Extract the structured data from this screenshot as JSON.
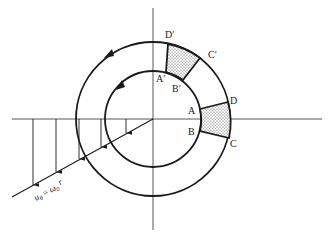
{
  "figure": {
    "colors": {
      "stroke": "#1a1a1a",
      "axis": "#444444",
      "background": "#ffffff",
      "stipple": "#333333"
    },
    "geometry": {
      "center": [
        153,
        119
      ],
      "outer_radius": 77,
      "inner_radius": 48,
      "horizontal_axis": [
        [
          12,
          119
        ],
        [
          322,
          119
        ]
      ],
      "vertical_axis": [
        [
          153,
          8
        ],
        [
          153,
          230
        ]
      ],
      "velocity_profile_line": [
        [
          153,
          119
        ],
        [
          12,
          197
        ]
      ]
    },
    "velocity_arrows_x": [
      33,
      56,
      79,
      101,
      126
    ],
    "circle_arrow_direction": "counterclockwise",
    "labels": {
      "A": "A",
      "B": "B",
      "C": "C",
      "D": "D",
      "A_prime": "A′",
      "B_prime": "B′",
      "C_prime": "C′",
      "D_prime": "D′"
    },
    "equation": {
      "lhs": "u",
      "lhs_sub": "θ",
      "eq": " = ",
      "rhs": "ω",
      "rhs_sub": "0",
      "rhs_tail": " r"
    },
    "element_initial": {
      "name": "ABCD",
      "corners": {
        "A": [
          200,
          109
        ],
        "B": [
          200,
          131
        ],
        "C": [
          229,
          138
        ],
        "D": [
          228,
          102
        ]
      }
    },
    "element_rotated": {
      "name": "A'B'C'D'",
      "corners": {
        "A_prime": [
          166,
          72
        ],
        "B_prime": [
          183,
          80
        ],
        "C_prime": [
          200,
          58
        ],
        "D_prime": [
          168,
          44
        ]
      }
    }
  }
}
